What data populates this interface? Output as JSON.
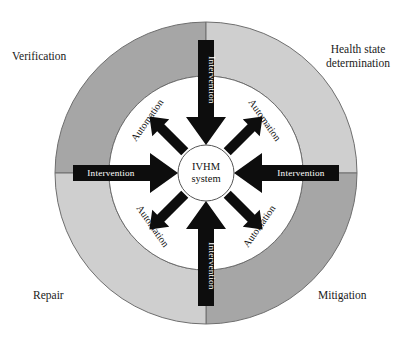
{
  "figure": {
    "type": "concentric-cycle-diagram",
    "background_color": "#ffffff"
  },
  "center": {
    "line1": "IVHM",
    "line2": "system"
  },
  "outer_labels": [
    {
      "id": "verification",
      "text": "Verification",
      "position": "top-left"
    },
    {
      "id": "health-state-determination",
      "text": "Health state\ndetermination",
      "position": "top-right"
    },
    {
      "id": "repair",
      "text": "Repair",
      "position": "bottom-left"
    },
    {
      "id": "mitigation",
      "text": "Mitigation",
      "position": "bottom-right"
    }
  ],
  "intervention_arrows": [
    {
      "id": "intervention-top",
      "label": "Intervention",
      "direction": "down"
    },
    {
      "id": "intervention-right",
      "label": "Intervention",
      "direction": "left"
    },
    {
      "id": "intervention-bottom",
      "label": "Intervention",
      "direction": "up"
    },
    {
      "id": "intervention-left",
      "label": "Intervention",
      "direction": "right"
    }
  ],
  "automation_arrows": [
    {
      "id": "automation-top-left",
      "label": "Automation",
      "direction": "up-left"
    },
    {
      "id": "automation-top-right",
      "label": "Automation",
      "direction": "up-right"
    },
    {
      "id": "automation-bottom-left",
      "label": "Automation",
      "direction": "down-left"
    },
    {
      "id": "automation-bottom-right",
      "label": "Automation",
      "direction": "down-right"
    }
  ],
  "colors": {
    "ring_dark": "#a6a6a6",
    "ring_light": "#cfcfcf",
    "ring_stroke": "#6e6e6e",
    "arrow_fill": "#0d0d0d",
    "inner_fill": "#ffffff",
    "text": "#1a1a1a",
    "arrow_text": "#ffffff"
  }
}
